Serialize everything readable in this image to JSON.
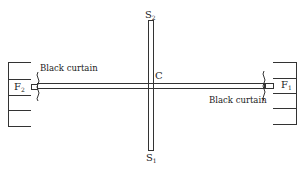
{
  "diagram": {
    "labels": {
      "s_top": "S",
      "s_top_sub": "2",
      "s_bottom": "S",
      "s_bottom_sub": "1",
      "center": "C",
      "f_left": "F",
      "f_left_sub": "2",
      "f_right": "F",
      "f_right_sub": "1",
      "curtain_left": "Black curtain",
      "curtain_right": "Black curtain"
    },
    "colors": {
      "stroke": "#333333",
      "background": "#ffffff"
    }
  }
}
